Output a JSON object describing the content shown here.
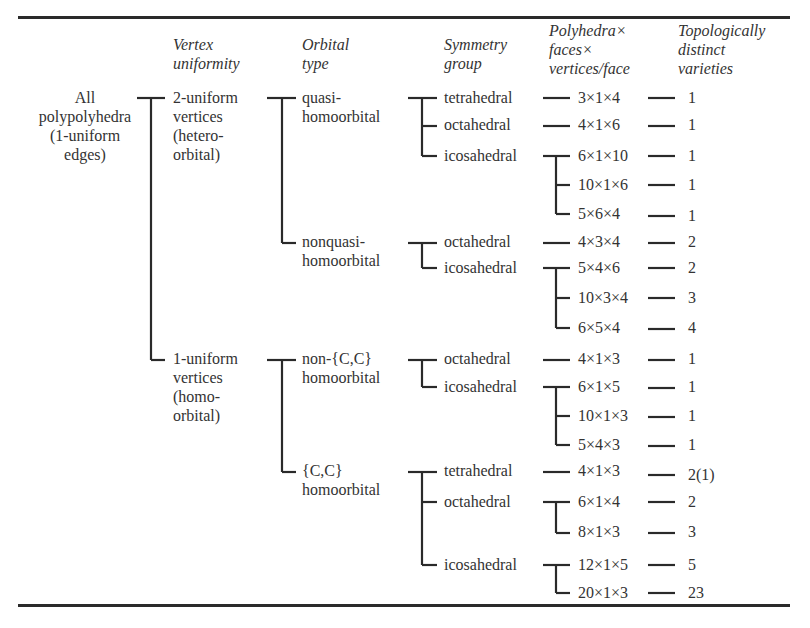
{
  "headers": {
    "vertex_uniformity": [
      "Vertex",
      "uniformity"
    ],
    "orbital_type": [
      "Orbital",
      "type"
    ],
    "symmetry_group": [
      "Symmetry",
      "group"
    ],
    "polyhedra": [
      "Polyhedra×",
      "faces×",
      "vertices/face"
    ],
    "varieties": [
      "Topologically",
      "distinct",
      "varieties"
    ]
  },
  "root": [
    "All",
    "polypolyhedra",
    "(1-uniform",
    "edges)"
  ],
  "vertex": {
    "v2": [
      "2-uniform",
      "vertices",
      "(hetero-",
      "orbital)"
    ],
    "v1": [
      "1-uniform",
      "vertices",
      "(homo-",
      "orbital)"
    ]
  },
  "orbital": {
    "quasi": [
      "quasi-",
      "homoorbital"
    ],
    "nonquasi": [
      "nonquasi-",
      "homoorbital"
    ],
    "noncc": [
      "non-{C,C}",
      "homoorbital"
    ],
    "cc": [
      "{C,C}",
      "homoorbital"
    ]
  },
  "rows": [
    {
      "symmetry": "tetrahedral",
      "polyhedra": "3×1×4",
      "varieties": "1"
    },
    {
      "symmetry": "octahedral",
      "polyhedra": "4×1×6",
      "varieties": "1"
    },
    {
      "symmetry": "icosahedral",
      "polyhedra": "6×1×10",
      "varieties": "1"
    },
    {
      "symmetry": "",
      "polyhedra": "10×1×6",
      "varieties": "1"
    },
    {
      "symmetry": "",
      "polyhedra": "5×6×4",
      "varieties": "1"
    },
    {
      "symmetry": "octahedral",
      "polyhedra": "4×3×4",
      "varieties": "2"
    },
    {
      "symmetry": "icosahedral",
      "polyhedra": "5×4×6",
      "varieties": "2"
    },
    {
      "symmetry": "",
      "polyhedra": "10×3×4",
      "varieties": "3"
    },
    {
      "symmetry": "",
      "polyhedra": "6×5×4",
      "varieties": "4"
    },
    {
      "symmetry": "octahedral",
      "polyhedra": "4×1×3",
      "varieties": "1"
    },
    {
      "symmetry": "icosahedral",
      "polyhedra": "6×1×5",
      "varieties": "1"
    },
    {
      "symmetry": "",
      "polyhedra": "10×1×3",
      "varieties": "1"
    },
    {
      "symmetry": "",
      "polyhedra": "5×4×3",
      "varieties": "1"
    },
    {
      "symmetry": "tetrahedral",
      "polyhedra": "4×1×3",
      "varieties": "2(1)"
    },
    {
      "symmetry": "octahedral",
      "polyhedra": "6×1×4",
      "varieties": "2"
    },
    {
      "symmetry": "",
      "polyhedra": "8×1×3",
      "varieties": "3"
    },
    {
      "symmetry": "icosahedral",
      "polyhedra": "12×1×5",
      "varieties": "5"
    },
    {
      "symmetry": "",
      "polyhedra": "20×1×3",
      "varieties": "23"
    }
  ]
}
